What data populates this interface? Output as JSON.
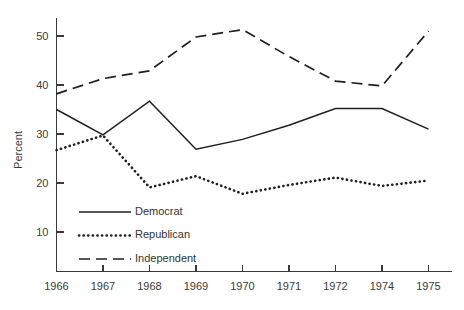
{
  "chart_data": {
    "type": "line",
    "title": "",
    "subtitle": "",
    "xlabel": "",
    "ylabel": "Percent",
    "x": [
      "1966",
      "1967",
      "1968",
      "1969",
      "1970",
      "1971",
      "1972",
      "1974",
      "1975"
    ],
    "categories": [
      "1966",
      "1967",
      "1968",
      "1969",
      "1970",
      "1971",
      "1972",
      "1974",
      "1975"
    ],
    "xticklabels": [
      "1966",
      "1967",
      "1968",
      "1969",
      "1970",
      "1971",
      "1972",
      "1974",
      "1975"
    ],
    "yticklabels": [
      "10",
      "20",
      "30",
      "40",
      "50"
    ],
    "yticks": [
      10,
      20,
      30,
      40,
      50
    ],
    "ylim": [
      0,
      55
    ],
    "xlim": [
      "1966",
      "1975"
    ],
    "grid": false,
    "legend_position": "lower-left-inside",
    "series": [
      {
        "name": "Democrat",
        "style": "solid",
        "color": "#1f1f1f",
        "values": [
          35.0,
          29.8,
          36.7,
          26.9,
          28.9,
          31.8,
          35.2,
          35.2,
          31.0
        ]
      },
      {
        "name": "Republican",
        "style": "dotted",
        "color": "#1f1f1f",
        "values": [
          26.7,
          29.7,
          19.1,
          21.4,
          17.8,
          19.6,
          21.1,
          19.4,
          20.5
        ]
      },
      {
        "name": "Independent",
        "style": "dashed",
        "color": "#1f1f1f",
        "values": [
          38.2,
          41.3,
          42.9,
          49.8,
          51.3,
          45.8,
          40.8,
          39.8,
          51.0
        ]
      }
    ]
  },
  "legend": {
    "entries": [
      {
        "label": "Democrat",
        "style": "solid"
      },
      {
        "label": "Republican",
        "style": "dotted"
      },
      {
        "label": "Independent",
        "style": "dashed"
      }
    ]
  },
  "axes": {
    "y_title": "Percent"
  },
  "colors": {
    "ink": "#1f1f1f",
    "axis": "#3a3a3a",
    "text": "#3b3b3b",
    "background": "#ffffff"
  }
}
